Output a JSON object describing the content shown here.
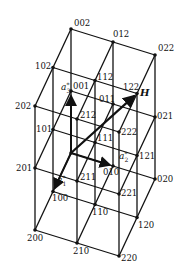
{
  "diagram": {
    "type": "reciprocal-lattice-grid",
    "origin_px": [
      71,
      153
    ],
    "basis_px": {
      "a1": [
        -18,
        38.5
      ],
      "a2": [
        42,
        13
      ],
      "a3": [
        0,
        -62
      ]
    },
    "range": [
      0,
      2
    ],
    "nodes": [
      {
        "label": "000",
        "i": [
          0,
          0,
          0
        ],
        "show": false
      },
      {
        "label": "001",
        "i": [
          0,
          0,
          1
        ],
        "dx": 2,
        "dy": -2
      },
      {
        "label": "002",
        "i": [
          0,
          0,
          2
        ],
        "dx": 3,
        "dy": -3
      },
      {
        "label": "010",
        "i": [
          0,
          1,
          0
        ],
        "dx": -10,
        "dy": 9
      },
      {
        "label": "011",
        "i": [
          0,
          1,
          1
        ],
        "dx": -14,
        "dy": -2
      },
      {
        "label": "012",
        "i": [
          0,
          1,
          2
        ],
        "dx": 0,
        "dy": -5
      },
      {
        "label": "020",
        "i": [
          0,
          2,
          0
        ],
        "dx": 2,
        "dy": 3
      },
      {
        "label": "021",
        "i": [
          0,
          2,
          1
        ],
        "dx": 2,
        "dy": 2
      },
      {
        "label": "022",
        "i": [
          0,
          2,
          2
        ],
        "dx": 3,
        "dy": -4
      },
      {
        "label": "100",
        "i": [
          1,
          0,
          0
        ],
        "dx": -1,
        "dy": 9
      },
      {
        "label": "101",
        "i": [
          1,
          0,
          1
        ],
        "dx": -17,
        "dy": 2
      },
      {
        "label": "102",
        "i": [
          1,
          0,
          2
        ],
        "dx": -18,
        "dy": 1
      },
      {
        "label": "110",
        "i": [
          1,
          1,
          0
        ],
        "dx": -3,
        "dy": 10
      },
      {
        "label": "111",
        "i": [
          1,
          1,
          1
        ],
        "dx": 2,
        "dy": -2
      },
      {
        "label": "112",
        "i": [
          1,
          1,
          2
        ],
        "dx": 2,
        "dy": -1
      },
      {
        "label": "120",
        "i": [
          1,
          2,
          0
        ],
        "dx": 1,
        "dy": 10
      },
      {
        "label": "121",
        "i": [
          1,
          2,
          1
        ],
        "dx": 2,
        "dy": 3
      },
      {
        "label": "122",
        "i": [
          1,
          2,
          2
        ],
        "dx": -14,
        "dy": -4
      },
      {
        "label": "200",
        "i": [
          2,
          0,
          0
        ],
        "dx": -8,
        "dy": 11
      },
      {
        "label": "201",
        "i": [
          2,
          0,
          1
        ],
        "dx": -19,
        "dy": 3
      },
      {
        "label": "202",
        "i": [
          2,
          0,
          2
        ],
        "dx": -20,
        "dy": 3
      },
      {
        "label": "210",
        "i": [
          2,
          1,
          0
        ],
        "dx": -4,
        "dy": 11
      },
      {
        "label": "211",
        "i": [
          2,
          1,
          1
        ],
        "dx": 3,
        "dy": -1
      },
      {
        "label": "212",
        "i": [
          2,
          1,
          2
        ],
        "dx": 3,
        "dy": -1
      },
      {
        "label": "220",
        "i": [
          2,
          2,
          0
        ],
        "dx": 2,
        "dy": 5
      },
      {
        "label": "221",
        "i": [
          2,
          2,
          1
        ],
        "dx": 2,
        "dy": 2
      },
      {
        "label": "222",
        "i": [
          2,
          2,
          2
        ],
        "dx": 2,
        "dy": 3
      }
    ],
    "vectors": [
      {
        "name": "a1*",
        "label": "a*1",
        "from": [
          0,
          0,
          0
        ],
        "to": [
          1,
          0,
          0
        ],
        "text": "a",
        "sup": "*",
        "sub": "1",
        "tx": 57,
        "ty": 183
      },
      {
        "name": "a2*",
        "label": "a*2",
        "from": [
          0,
          0,
          0
        ],
        "to": [
          0,
          1,
          0
        ],
        "text": "a",
        "sup": "*",
        "sub": "2",
        "tx": 119,
        "ty": 159
      },
      {
        "name": "a3*",
        "label": "a*3",
        "from": [
          0,
          0,
          0
        ],
        "to": [
          0,
          0,
          1
        ],
        "text": "a",
        "sup": "*",
        "sub": "3",
        "tx": 61,
        "ty": 90
      }
    ],
    "H": {
      "label": "H",
      "to": [
        1,
        2,
        2
      ],
      "tx": 140,
      "ty": 96
    }
  }
}
